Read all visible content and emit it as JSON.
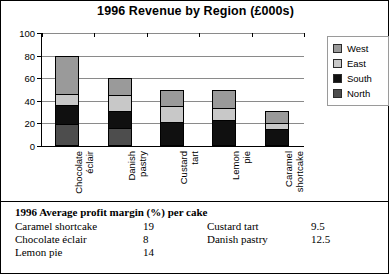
{
  "chart_data": {
    "type": "bar",
    "subtype": "stacked-column",
    "title": "1996 Revenue by Region (£000s)",
    "xlabel": "",
    "ylabel": "",
    "ylim": [
      0,
      100
    ],
    "yticks": [
      0,
      20,
      40,
      60,
      80,
      100
    ],
    "grid": true,
    "legend_position": "right",
    "categories": [
      "Chocolate éclair",
      "Danish pastry",
      "Custard tart",
      "Lemon pie",
      "Caramel shortcake"
    ],
    "category_lines": [
      [
        "Chocolate",
        "éclair"
      ],
      [
        "Danish",
        "pastry"
      ],
      [
        "Custard",
        "tart"
      ],
      [
        "Lemon",
        "pie"
      ],
      [
        "Caramel",
        "shortcake"
      ]
    ],
    "series": [
      {
        "name": "North",
        "color": "#4d4d4d",
        "values": [
          18,
          15,
          0,
          0,
          0
        ]
      },
      {
        "name": "South",
        "color": "#101010",
        "values": [
          17,
          15,
          20,
          22,
          14
        ]
      },
      {
        "name": "East",
        "color": "#c8c8c8",
        "values": [
          10,
          15,
          15,
          11,
          6
        ]
      },
      {
        "name": "West",
        "color": "#9a9a9a",
        "values": [
          35,
          15,
          15,
          17,
          11
        ]
      }
    ],
    "totals": [
      80,
      60,
      50,
      50,
      31
    ]
  },
  "legend": {
    "items": [
      {
        "label": "West",
        "color": "#9a9a9a"
      },
      {
        "label": "East",
        "color": "#c8c8c8"
      },
      {
        "label": "South",
        "color": "#101010"
      },
      {
        "label": "North",
        "color": "#4d4d4d"
      }
    ]
  },
  "profit_table": {
    "title": "1996 Average profit margin (%) per cake",
    "rows": [
      {
        "name_left": "Caramel shortcake",
        "value_left": "19",
        "name_right": "Custard tart",
        "value_right": "9.5"
      },
      {
        "name_left": "Chocolate éclair",
        "value_left": "8",
        "name_right": "Danish pastry",
        "value_right": "12.5"
      },
      {
        "name_left": "Lemon pie",
        "value_left": "14",
        "name_right": "",
        "value_right": ""
      }
    ]
  }
}
